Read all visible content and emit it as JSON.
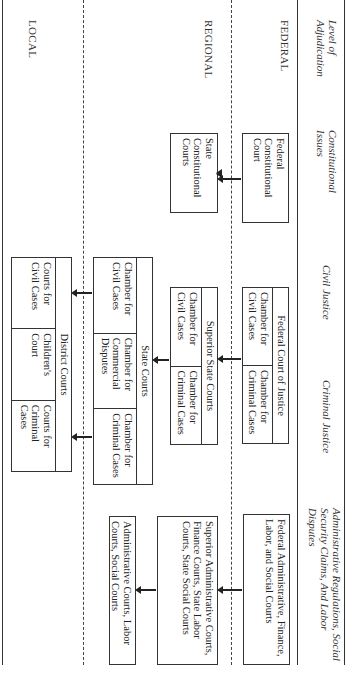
{
  "headers": {
    "level": "Level of Adjudication",
    "constitutional": "Constitutional Issues",
    "civil": "Civil Justice",
    "criminal": "Criminal Justice",
    "administrative": "Administrative Regulations, Social Security Claims, And Labor Disputes"
  },
  "levels": {
    "federal": "FEDERAL",
    "regional": "REGIONAL",
    "local": "LOCAL"
  },
  "boxes": {
    "federal_constitutional": "Federal Constitutional Court",
    "state_constitutional": "State Constitutional Courts",
    "federal_court_of_justice": {
      "title": "Federal Court of Justice",
      "cells": [
        "Chamber for Civil Cases",
        "Chamber for Criminal Cases"
      ]
    },
    "superior_state_courts": {
      "title": "Superior State Courts",
      "cells": [
        "Chamber for Civil Cases",
        "Chamber for Criminal Cases"
      ]
    },
    "state_courts": {
      "title": "State Courts",
      "cells": [
        "Chamber for Civil Cases",
        "Chamber for Commercial Disputes",
        "Chamber for Criminal Cases"
      ]
    },
    "district_courts": {
      "title": "District Courts",
      "cells": [
        "Courts for Civil Cases",
        "Children's Court",
        "Courts for Criminal Cases"
      ]
    },
    "federal_admin": "Federal Administrative, Finance, Labor, and Social Courts",
    "superior_admin": "Superior Administrative Courts, Finance Courts, State Labor Courts, State Social Courts",
    "local_admin": "Administrative Courts, Labor Courts, Social Courts"
  }
}
